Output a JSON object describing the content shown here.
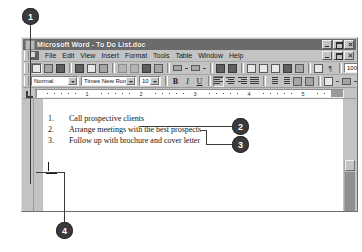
{
  "window": {
    "title": "Microsoft Word - To Do List.doc",
    "title_icon": "word-document-icon",
    "app_buttons": [
      {
        "name": "minimize",
        "glyph": "minimize-icon"
      },
      {
        "name": "restore",
        "glyph": "restore-icon"
      },
      {
        "name": "close",
        "glyph": "close-icon"
      }
    ],
    "doc_buttons": [
      {
        "name": "minimize",
        "glyph": "minimize-icon"
      },
      {
        "name": "restore",
        "glyph": "restore-icon"
      },
      {
        "name": "close",
        "glyph": "close-icon"
      }
    ]
  },
  "menubar": {
    "items": [
      {
        "label": "File",
        "accel": "F"
      },
      {
        "label": "Edit",
        "accel": "E"
      },
      {
        "label": "View",
        "accel": "V"
      },
      {
        "label": "Insert",
        "accel": "I"
      },
      {
        "label": "Format",
        "accel": "o"
      },
      {
        "label": "Tools",
        "accel": "T"
      },
      {
        "label": "Table",
        "accel": "a"
      },
      {
        "label": "Window",
        "accel": "W"
      },
      {
        "label": "Help",
        "accel": "H"
      }
    ]
  },
  "toolbar_standard": {
    "buttons": [
      {
        "name": "new-document-icon"
      },
      {
        "name": "open-icon"
      },
      {
        "name": "save-icon"
      },
      {
        "name": "print-icon"
      },
      {
        "name": "print-preview-icon"
      },
      {
        "name": "spelling-grammar-icon"
      },
      {
        "name": "cut-icon"
      },
      {
        "name": "copy-icon"
      },
      {
        "name": "paste-icon"
      },
      {
        "name": "format-painter-icon"
      },
      {
        "name": "undo-icon"
      },
      {
        "name": "redo-icon"
      },
      {
        "name": "insert-hyperlink-icon"
      },
      {
        "name": "web-toolbar-icon"
      },
      {
        "name": "tables-and-borders-icon"
      },
      {
        "name": "insert-table-icon"
      },
      {
        "name": "insert-excel-worksheet-icon"
      },
      {
        "name": "columns-icon"
      },
      {
        "name": "drawing-icon"
      },
      {
        "name": "document-map-icon"
      },
      {
        "name": "show-formatting-marks-icon"
      }
    ],
    "zoom_value": "100%",
    "help_button": "office-assistant-help-icon"
  },
  "toolbar_formatting": {
    "style_value": "Normal",
    "font_value": "Times New Roman",
    "size_value": "10",
    "bold_label": "B",
    "italic_label": "I",
    "underline_label": "U",
    "buttons": [
      {
        "name": "align-left-icon"
      },
      {
        "name": "align-center-icon"
      },
      {
        "name": "align-right-icon"
      },
      {
        "name": "justify-icon"
      },
      {
        "name": "numbered-list-icon"
      },
      {
        "name": "bulleted-list-icon"
      },
      {
        "name": "decrease-indent-icon"
      },
      {
        "name": "increase-indent-icon"
      },
      {
        "name": "borders-icon"
      },
      {
        "name": "highlight-icon"
      },
      {
        "name": "font-color-icon"
      }
    ]
  },
  "ruler": {
    "corner": "tab-stop-selector",
    "numbers": [
      "1",
      "2",
      "3",
      "4",
      "5"
    ]
  },
  "document": {
    "lines": [
      {
        "number": "1.",
        "text": "Call prospective clients"
      },
      {
        "number": "2.",
        "text": "Arrange meetings with the best prospects"
      },
      {
        "number": "3.",
        "text": "Follow up with brochure and cover letter"
      }
    ],
    "caret": "insertion-point"
  },
  "callouts": [
    {
      "id": "1",
      "label": "1"
    },
    {
      "id": "2",
      "label": "2"
    },
    {
      "id": "3",
      "label": "3"
    },
    {
      "id": "4",
      "label": "4"
    }
  ],
  "colors": {
    "callout_fill": "#3b3b3b",
    "callout_text": "#ffffff",
    "titlebar": "#6b6b6b",
    "chrome": "#c3c3c3",
    "page": "#ffffff"
  }
}
